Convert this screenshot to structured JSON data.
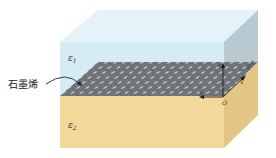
{
  "diagram": {
    "title": "",
    "labels": {
      "upper_medium": "ε",
      "upper_medium_sub": "1",
      "lower_medium": "ε",
      "lower_medium_sub": "2",
      "sheet": "石墨烯",
      "origin": "O",
      "axis_x": "x",
      "axis_y": "y",
      "axis_z": "z",
      "wave": "SPP"
    },
    "colors": {
      "upper_front": "#d6ecf5",
      "upper_top": "#e4f3fa",
      "upper_side": "#b9c9d1",
      "lower_front": "#f2d99a",
      "lower_side": "#e3c684",
      "graphene": "#6f7378",
      "graphene_dot": "#c9cdd2",
      "axis": "#1a1a1a"
    }
  }
}
